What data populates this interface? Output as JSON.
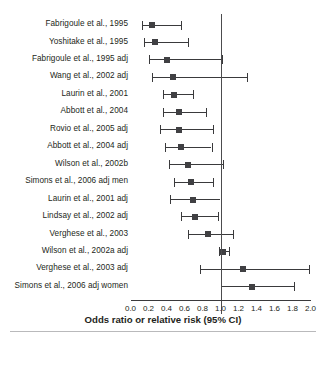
{
  "chart_data": {
    "type": "forest",
    "title": "",
    "xlabel": "Odds ratio or relative risk (95% CI)",
    "ylabel": "",
    "xlim": [
      0.0,
      2.0
    ],
    "xticks": [
      "0.0",
      "0.2",
      "0.4",
      "0.6",
      "0.8",
      "1.0",
      "1.2",
      "1.4",
      "1.6",
      "1.8",
      "2.0"
    ],
    "xtick_values": [
      0.0,
      0.2,
      0.4,
      0.6,
      0.8,
      1.0,
      1.2,
      1.4,
      1.6,
      1.8,
      2.0
    ],
    "reference_line": 1.0,
    "grid": false,
    "legend": "none",
    "categories": [
      "Fabrigoule et al., 1995",
      "Yoshitake et al., 1995",
      "Fabrigoule et al., 1995 adj",
      "Wang et al., 2002 adj",
      "Laurin et al., 2001",
      "Abbott et al., 2004",
      "Rovio et al., 2005 adj",
      "Abbott et al., 2004 adj",
      "Wilson et al., 2002b",
      "Simons et al., 2006 adj men",
      "Laurin et al., 2001 adj",
      "Lindsay et al., 2002 adj",
      "Verghese et al., 2003",
      "Wilson et al., 2002a adj",
      "Verghese et al., 2003 adj",
      "Simons et al., 2006 adj women"
    ],
    "points": [
      {
        "label": "Fabrigoule et al., 1995",
        "estimate": 0.24,
        "ci_low": 0.13,
        "ci_high": 0.56
      },
      {
        "label": "Yoshitake et al., 1995",
        "estimate": 0.27,
        "ci_low": 0.15,
        "ci_high": 0.64
      },
      {
        "label": "Fabrigoule et al., 1995 adj",
        "estimate": 0.4,
        "ci_low": 0.21,
        "ci_high": 1.02
      },
      {
        "label": "Wang et al., 2002 adj",
        "estimate": 0.47,
        "ci_low": 0.24,
        "ci_high": 1.29
      },
      {
        "label": "Laurin et al., 2001",
        "estimate": 0.48,
        "ci_low": 0.36,
        "ci_high": 0.69
      },
      {
        "label": "Abbott et al., 2004",
        "estimate": 0.54,
        "ci_low": 0.36,
        "ci_high": 0.84
      },
      {
        "label": "Rovio et al., 2005 adj",
        "estimate": 0.54,
        "ci_low": 0.33,
        "ci_high": 0.92
      },
      {
        "label": "Abbott et al., 2004 adj",
        "estimate": 0.56,
        "ci_low": 0.38,
        "ci_high": 0.9
      },
      {
        "label": "Wilson et al., 2002b",
        "estimate": 0.64,
        "ci_low": 0.43,
        "ci_high": 1.03
      },
      {
        "label": "Simons et al., 2006 adj men",
        "estimate": 0.67,
        "ci_low": 0.48,
        "ci_high": 0.92
      },
      {
        "label": "Laurin et al., 2001 adj",
        "estimate": 0.69,
        "ci_low": 0.44,
        "ci_high": 1.0
      },
      {
        "label": "Lindsay et al., 2002 adj",
        "estimate": 0.72,
        "ci_low": 0.56,
        "ci_high": 0.97
      },
      {
        "label": "Verghese et al., 2003",
        "estimate": 0.86,
        "ci_low": 0.64,
        "ci_high": 1.14
      },
      {
        "label": "Wilson et al., 2002a adj",
        "estimate": 1.03,
        "ci_low": 0.98,
        "ci_high": 1.09
      },
      {
        "label": "Verghese et al., 2003 adj",
        "estimate": 1.25,
        "ci_low": 0.77,
        "ci_high": 1.98
      },
      {
        "label": "Simons et al., 2006 adj women",
        "estimate": 1.35,
        "ci_low": 1.0,
        "ci_high": 1.82
      }
    ],
    "colors": {
      "marker": "#404043",
      "line": "#3a3a3c",
      "reference": "#4c4c4e",
      "text": "#231f20",
      "background": "#ffffff"
    }
  }
}
